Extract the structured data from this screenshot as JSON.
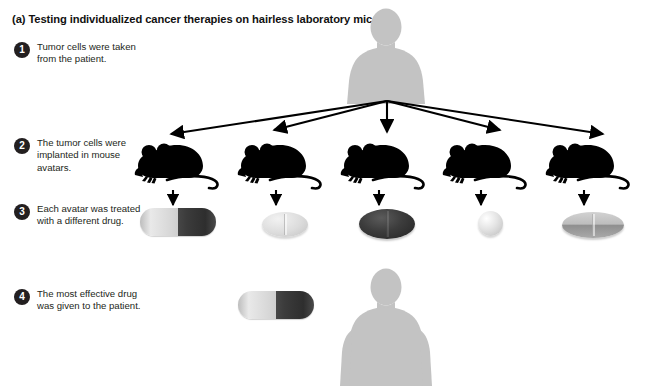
{
  "figure": {
    "panel_label": "(a)",
    "title": "(a) Testing individualized cancer therapies on hairless laboratory mice",
    "background_color": "#ffffff",
    "silhouette_color": "#c3c3c3",
    "mouse_color": "#000000",
    "badge_color": "#231f20",
    "text_color": "#231f20"
  },
  "steps": [
    {
      "number": "1",
      "text": "Tumor cells were taken from the patient."
    },
    {
      "number": "2",
      "text": "The tumor cells were implanted in mouse avatars."
    },
    {
      "number": "3",
      "text": "Each avatar was treated with a different drug."
    },
    {
      "number": "4",
      "text": "The most effective drug was given to the patient."
    }
  ],
  "figures": {
    "patient_top": "human-silhouette",
    "patient_bottom": "human-silhouette",
    "mice": [
      {
        "id": "mouse-1",
        "label": "mouse-avatar"
      },
      {
        "id": "mouse-2",
        "label": "mouse-avatar"
      },
      {
        "id": "mouse-3",
        "label": "mouse-avatar"
      },
      {
        "id": "mouse-4",
        "label": "mouse-avatar"
      },
      {
        "id": "mouse-5",
        "label": "mouse-avatar"
      }
    ]
  },
  "drugs": [
    {
      "id": "pill-1",
      "shape": "capsule",
      "colors": [
        "#d8d8d8",
        "#3a3a3a"
      ]
    },
    {
      "id": "pill-2",
      "shape": "oval-tablet",
      "colors": [
        "#dcdcdc"
      ]
    },
    {
      "id": "pill-3",
      "shape": "oval-tablet",
      "colors": [
        "#333333"
      ]
    },
    {
      "id": "pill-4",
      "shape": "sphere",
      "colors": [
        "#e4e4e4"
      ]
    },
    {
      "id": "pill-5",
      "shape": "disc-tablet",
      "colors": [
        "#bdbdbd"
      ]
    }
  ],
  "selected_drug": {
    "id": "pill-final",
    "shape": "capsule",
    "colors": [
      "#d8d8d8",
      "#3a3a3a"
    ]
  },
  "arrows": {
    "distribution_count": 5,
    "treatment_count": 5,
    "color": "#000000"
  }
}
